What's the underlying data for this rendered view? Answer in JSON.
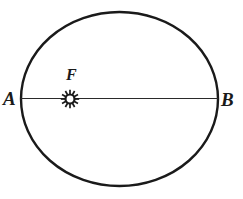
{
  "figure": {
    "kind": "ellipse-orbit-diagram",
    "background_color": "#ffffff",
    "ink_color": "#1a1a1a",
    "width": 243,
    "height": 199
  },
  "labels": {
    "left_vertex": "A",
    "right_vertex": "B",
    "focus": "F"
  },
  "icons": {
    "sun": "sun-icon"
  },
  "chart_data": {
    "type": "scatter",
    "title": "",
    "subtitle": "",
    "xlabel": "",
    "ylabel": "",
    "grid": false,
    "legend": null,
    "ellipse": {
      "center_x": 119.5,
      "center_y": 99,
      "semi_major_axis": 98.5,
      "semi_minor_axis": 87,
      "stroke_width": 2.4
    },
    "major_axis_line": {
      "x1": 21,
      "y1": 98.5,
      "x2": 218,
      "y2": 98.5,
      "stroke_width": 1.1
    },
    "points": [
      {
        "label": "A",
        "x": 21,
        "y": 98.5,
        "role": "left-vertex"
      },
      {
        "label": "B",
        "x": 218,
        "y": 98.5,
        "role": "right-vertex"
      },
      {
        "label": "F",
        "x": 70,
        "y": 99,
        "role": "focus",
        "marker": "sun-icon"
      }
    ],
    "sun_marker": {
      "center_x": 70,
      "center_y": 99,
      "ring_outer_radius": 5.6,
      "ring_inner_radius": 3.4,
      "spike_count": 12,
      "spike_length": 3.6
    }
  }
}
